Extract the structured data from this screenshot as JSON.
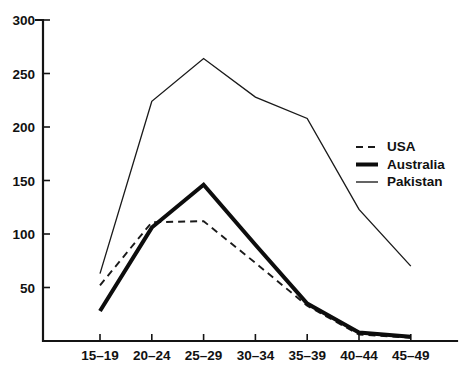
{
  "chart_data": {
    "type": "line",
    "title": "",
    "subtitle": "",
    "xlabel": "",
    "ylabel": "",
    "categories": [
      "15–19",
      "20–24",
      "25–29",
      "30–34",
      "35–39",
      "40–44",
      "45–49"
    ],
    "x_tick_labels": [
      "15–19",
      "20–24",
      "25–29",
      "30–34",
      "35–39",
      "40–44",
      "45–49"
    ],
    "y_tick_labels": [
      "50",
      "100",
      "150",
      "200",
      "250",
      "300"
    ],
    "y_ticks": [
      50,
      100,
      150,
      200,
      250,
      300
    ],
    "ylim": [
      0,
      300
    ],
    "grid": false,
    "legend_position": "right",
    "series": [
      {
        "name": "USA",
        "style": "dashed",
        "color": "#1a1a1a",
        "values": [
          52,
          111,
          112,
          73,
          33,
          6,
          3
        ]
      },
      {
        "name": "Australia",
        "style": "solid-thick",
        "color": "#0d0d0d",
        "values": [
          28,
          106,
          146,
          90,
          35,
          8,
          4
        ]
      },
      {
        "name": "Pakistan",
        "style": "solid-thin",
        "color": "#1a1a1a",
        "values": [
          63,
          224,
          264,
          228,
          208,
          123,
          70
        ]
      }
    ],
    "legend": [
      {
        "label": "USA",
        "style": "dashed"
      },
      {
        "label": "Australia",
        "style": "solid-thick"
      },
      {
        "label": "Pakistan",
        "style": "solid-thin"
      }
    ]
  }
}
